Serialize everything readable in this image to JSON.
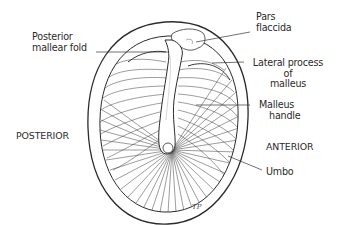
{
  "diagram": {
    "labels": {
      "posterior_mallear_fold": [
        "Posterior",
        "mallear fold"
      ],
      "pars_flaccida": [
        "Pars",
        "flaccida"
      ],
      "lateral_process": [
        "Lateral process",
        "of",
        "malleus"
      ],
      "malleus_handle": [
        "Malleus",
        "handle"
      ],
      "umbo": "Umbo",
      "posterior": "POSTERIOR",
      "anterior": "ANTERIOR"
    },
    "signature": "TP",
    "colors": {
      "ink": "#2b2b2b",
      "background": "#ffffff"
    }
  }
}
